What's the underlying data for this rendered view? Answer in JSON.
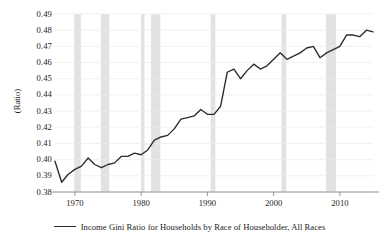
{
  "chart_data": {
    "type": "line",
    "title": "",
    "subtitle": "",
    "xlabel": "",
    "ylabel": "(Ratio)",
    "xlim": [
      1967,
      2015
    ],
    "ylim": [
      0.38,
      0.49
    ],
    "grid": true,
    "legend_position": "bottom",
    "y_ticks": [
      "0.49",
      "0.48",
      "0.47",
      "0.46",
      "0.45",
      "0.44",
      "0.43",
      "0.42",
      "0.41",
      "0.40",
      "0.39",
      "0.38"
    ],
    "y_tick_values": [
      0.49,
      0.48,
      0.47,
      0.46,
      0.45,
      0.44,
      0.43,
      0.42,
      0.41,
      0.4,
      0.39,
      0.38
    ],
    "x_ticks": [
      "1970",
      "1980",
      "1990",
      "2000",
      "2010"
    ],
    "x_tick_values": [
      1970,
      1980,
      1990,
      2000,
      2010
    ],
    "line_color": "#2b2b2b",
    "recession_band_color": "#e2e2e2",
    "axis_color": "#8a8a8a",
    "grid_color": "#ebebeb",
    "series": [
      {
        "name": "Income Gini Ratio for Households by Race of Householder, All Races",
        "color": "#2b2b2b",
        "x": [
          1967,
          1968,
          1969,
          1970,
          1971,
          1972,
          1973,
          1974,
          1975,
          1976,
          1977,
          1978,
          1979,
          1980,
          1981,
          1982,
          1983,
          1984,
          1985,
          1986,
          1987,
          1988,
          1989,
          1990,
          1991,
          1992,
          1993,
          1994,
          1995,
          1996,
          1997,
          1998,
          1999,
          2000,
          2001,
          2002,
          2003,
          2004,
          2005,
          2006,
          2007,
          2008,
          2009,
          2010,
          2011,
          2012,
          2013,
          2014,
          2015
        ],
        "values": [
          0.399,
          0.386,
          0.391,
          0.394,
          0.396,
          0.401,
          0.397,
          0.395,
          0.397,
          0.398,
          0.402,
          0.402,
          0.404,
          0.403,
          0.406,
          0.412,
          0.414,
          0.415,
          0.419,
          0.425,
          0.426,
          0.427,
          0.431,
          0.428,
          0.428,
          0.433,
          0.454,
          0.456,
          0.45,
          0.455,
          0.459,
          0.456,
          0.458,
          0.462,
          0.466,
          0.462,
          0.464,
          0.466,
          0.469,
          0.47,
          0.463,
          0.466,
          0.468,
          0.47,
          0.477,
          0.477,
          0.476,
          0.48,
          0.479
        ]
      }
    ],
    "recession_bands": [
      {
        "start": 1969.9,
        "end": 1970.9
      },
      {
        "start": 1973.9,
        "end": 1975.2
      },
      {
        "start": 1980.0,
        "end": 1980.5
      },
      {
        "start": 1981.5,
        "end": 1982.9
      },
      {
        "start": 1990.5,
        "end": 1991.2
      },
      {
        "start": 2001.2,
        "end": 2001.9
      },
      {
        "start": 2007.9,
        "end": 2009.4
      }
    ]
  },
  "legend": {
    "entries": [
      {
        "label": "Income Gini Ratio for Households by Race of Householder, All Races"
      }
    ]
  }
}
